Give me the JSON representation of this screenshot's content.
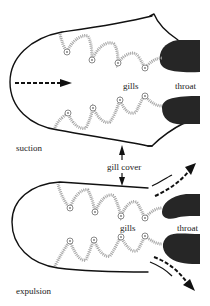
{
  "diagram": {
    "panels": [
      {
        "id": "suction",
        "label": "suction",
        "parts": {
          "gills": "gills",
          "throat": "throat"
        }
      },
      {
        "id": "expulsion",
        "label": "expulsion",
        "parts": {
          "gills": "gills",
          "throat": "throat"
        }
      }
    ],
    "shared_label": "gill cover",
    "colors": {
      "outline": "#111111",
      "throat": "#262626",
      "gills": "#9a9a9a",
      "text": "#222222"
    }
  }
}
